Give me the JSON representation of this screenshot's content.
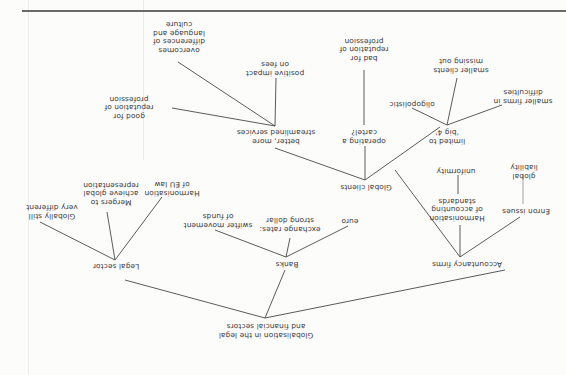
{
  "diagram": {
    "title": "Globalisation in the legal and financial sectors",
    "orientation": "rotated-180",
    "nodes": {
      "root": "Globalisation in the legal\nand financial sectors",
      "legal": "Legal sector",
      "legal_globally": "Globally still\nvery different",
      "legal_mergers": "Mergers to\nachieve global\nrepresentation",
      "legal_harmonisation": "Harmonisation\nof EU law",
      "banks": "Banks",
      "banks_swifter": "swifter movement\nof funds",
      "banks_exchange": "exchange rates:\nstrong dollar",
      "banks_euro": "euro",
      "accountancy": "Accountancy firms",
      "acc_enron": "Enron issues",
      "acc_global_liability": "global\nliability",
      "acc_harmonisation": "Harmonisation\nof accounting\nstandards",
      "acc_uniformity": "uniformity",
      "global_clients": "Global clients",
      "gc_better": "better, more\nstreamlined services",
      "gc_good_rep": "good for\nreputation of\nprofession",
      "gc_positive_fees": "positive impact\non fees",
      "gc_overcomes": "overcomes\ndifferences of\nlanguage and\nculture",
      "gc_cartel": "operating a\ncartel?",
      "gc_bad_rep": "bad for\nreputation of\nprofession",
      "gc_big4": "limited to\n'big 4'",
      "gc_oligopolistic": "oligopolistic",
      "gc_smaller_clients": "smaller clients\nmissing out",
      "gc_smaller_firms": "smaller firms in\ndifficulties"
    }
  },
  "colors": {
    "ink": "#3a3a3a",
    "lines": "#4a4a4a",
    "paper": "#fcfcfb",
    "rule": "#6a6a6a"
  }
}
